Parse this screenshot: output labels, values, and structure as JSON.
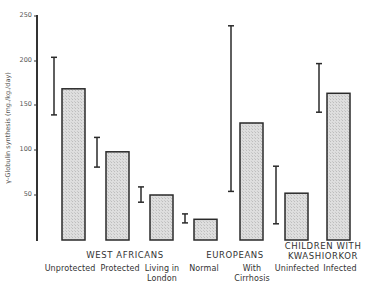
{
  "chart_data": {
    "type": "bar",
    "title": "",
    "xlabel": "",
    "ylabel": "γ-Globulin synthesis (mg./kg./day)",
    "ylim": [
      0,
      250
    ],
    "yticks": [
      50,
      100,
      150,
      200,
      250
    ],
    "grid": false,
    "legend": null,
    "groups": [
      {
        "name": "WEST AFRICANS",
        "categories": [
          "Unprotected",
          "Protected",
          "Living in London"
        ]
      },
      {
        "name": "EUROPEANS",
        "categories": [
          "Normal",
          "With Cirrhosis"
        ]
      },
      {
        "name": "CHILDREN WITH KWASHIORKOR",
        "categories": [
          "Uninfected",
          "Infected"
        ]
      }
    ],
    "categories": [
      "Unprotected",
      "Protected",
      "Living in London",
      "Normal",
      "With Cirrhosis",
      "Uninfected",
      "Infected"
    ],
    "values": [
      168,
      98,
      50,
      23,
      130,
      52,
      163
    ],
    "ranges": [
      [
        139,
        203
      ],
      [
        81,
        114
      ],
      [
        42,
        59
      ],
      [
        19,
        29
      ],
      [
        54,
        238
      ],
      [
        18,
        82
      ],
      [
        142,
        196
      ]
    ],
    "annotations": "Vertical I-bars to the left of each bar show range of individual values"
  },
  "axis": {
    "ticks": [
      "250",
      "200",
      "150",
      "100",
      "50"
    ],
    "ylabel": "γ-Globulin synthesis (mg./kg./day)"
  },
  "labels": {
    "group1": "WEST  AFRICANS",
    "group2": "EUROPEANS",
    "group3a": "CHILDREN  WITH",
    "group3b": "KWASHIORKOR",
    "cat1": "Unprotected",
    "cat2": "Protected",
    "cat3a": "Living in",
    "cat3b": "London",
    "cat4": "Normal",
    "cat5a": "With",
    "cat5b": "Cirrhosis",
    "cat6": "Uninfected",
    "cat7": "Infected"
  },
  "colors": {
    "bar_fill": "#d9d9d9",
    "bar_stroke": "#2a2a2a",
    "axis": "#333333"
  }
}
